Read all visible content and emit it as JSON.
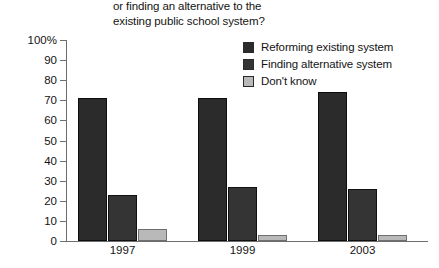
{
  "chart_data": {
    "type": "bar",
    "title": "or finding an alternative to the existing public school system?",
    "title_lines": [
      "or finding an alternative to the",
      "existing public school system?"
    ],
    "xlabel": "",
    "ylabel": "",
    "ylim": [
      0,
      100
    ],
    "yticks": [
      {
        "value": 100,
        "label": "100%"
      },
      {
        "value": 90,
        "label": "90"
      },
      {
        "value": 80,
        "label": "80"
      },
      {
        "value": 70,
        "label": "70"
      },
      {
        "value": 60,
        "label": "60"
      },
      {
        "value": 50,
        "label": "50"
      },
      {
        "value": 40,
        "label": "40"
      },
      {
        "value": 30,
        "label": "30"
      },
      {
        "value": 20,
        "label": "20"
      },
      {
        "value": 10,
        "label": "10"
      },
      {
        "value": 0,
        "label": "0"
      }
    ],
    "grid": false,
    "legend_position": "top-right",
    "categories": [
      "1997",
      "1999",
      "2003"
    ],
    "series": [
      {
        "name": "Reforming existing system",
        "color": "#2b2b2b",
        "values": [
          71,
          71,
          74
        ]
      },
      {
        "name": "Finding alternative system",
        "color": "#343434",
        "values": [
          23,
          27,
          26
        ]
      },
      {
        "name": "Don't know",
        "color": "#b9b9b9",
        "values": [
          6,
          3,
          3
        ]
      }
    ]
  }
}
